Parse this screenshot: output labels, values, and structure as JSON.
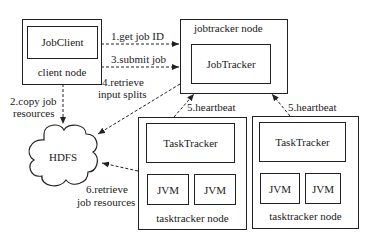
{
  "client_node": {
    "label": "client node",
    "component": "JobClient"
  },
  "jobtracker_node": {
    "label": "jobtracker node",
    "component": "JobTracker"
  },
  "tasktracker_nodes": [
    {
      "label": "tasktracker node",
      "component": "TaskTracker",
      "jvms": [
        "JVM",
        "JVM"
      ]
    },
    {
      "label": "tasktracker node",
      "component": "TaskTracker",
      "jvms": [
        "JVM",
        "JVM"
      ]
    }
  ],
  "hdfs": {
    "label": "HDFS"
  },
  "steps": {
    "s1": "1.get job ID",
    "s2a": "2.copy job",
    "s2b": "resources",
    "s3": "3.submit job",
    "s4a": "4.retrieve",
    "s4b": "input splits",
    "s5a": "5.heartbeat",
    "s5b": "5.heartbeat",
    "s6a": "6.retrieve",
    "s6b": "job resources"
  }
}
